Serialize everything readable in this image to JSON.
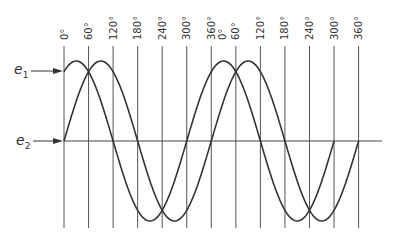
{
  "diagram": {
    "type": "phase-shifted sine waves",
    "labels": {
      "e1": {
        "base": "e",
        "sub": "1"
      },
      "e2": {
        "base": "e",
        "sub": "2"
      }
    },
    "cycle1_ticks": [
      "0°",
      "60°",
      "120°",
      "180°",
      "240°",
      "300°",
      "360°"
    ],
    "cycle2_ticks": [
      "0°",
      "60°",
      "120°",
      "180°",
      "240°",
      "300°",
      "360°"
    ],
    "phase_lead_degrees": 60,
    "colors": {
      "line": "#333333",
      "grid": "#555555",
      "background": "#ffffff"
    }
  }
}
